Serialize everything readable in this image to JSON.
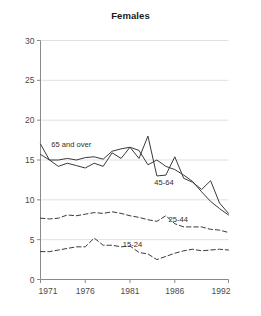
{
  "chart_data": {
    "type": "line",
    "title": "Females",
    "xlabel": "",
    "ylabel": "",
    "xlim": [
      1971,
      1992
    ],
    "ylim": [
      0,
      30
    ],
    "grid": true,
    "legend_position": "inline-labels",
    "x": [
      1971,
      1972,
      1973,
      1974,
      1975,
      1976,
      1977,
      1978,
      1979,
      1980,
      1981,
      1982,
      1983,
      1984,
      1985,
      1986,
      1987,
      1988,
      1989,
      1990,
      1991,
      1992
    ],
    "xticks": [
      1971,
      1976,
      1981,
      1986,
      1992
    ],
    "xticklabels": [
      "1971",
      "1976",
      "1981",
      "1986",
      "1992"
    ],
    "yticks": [
      0,
      5,
      10,
      15,
      20,
      25,
      30
    ],
    "yticklabels": [
      "0",
      "5",
      "10",
      "15",
      "20",
      "25",
      "30"
    ],
    "series": [
      {
        "name": "65 and over",
        "style": "solid",
        "label": "65 and over",
        "values": [
          17.0,
          15.0,
          14.2,
          14.6,
          14.3,
          14.0,
          14.6,
          14.2,
          15.9,
          15.2,
          16.6,
          15.2,
          18.0,
          13.0,
          13.1,
          15.4,
          12.7,
          12.2,
          11.3,
          12.4,
          9.6,
          8.3
        ]
      },
      {
        "name": "45-64",
        "style": "solid",
        "label": "45-64",
        "values": [
          15.7,
          15.0,
          15.0,
          15.2,
          15.0,
          15.3,
          15.4,
          15.1,
          16.1,
          16.4,
          16.6,
          16.2,
          14.4,
          15.0,
          14.2,
          13.8,
          13.1,
          12.3,
          11.0,
          9.8,
          8.9,
          8.1
        ]
      },
      {
        "name": "25-44",
        "style": "dashed",
        "label": "25-44",
        "values": [
          7.7,
          7.6,
          7.7,
          8.1,
          8.0,
          8.2,
          8.4,
          8.3,
          8.5,
          8.3,
          8.0,
          7.8,
          7.5,
          7.3,
          8.0,
          7.0,
          6.6,
          6.6,
          6.6,
          6.3,
          6.2,
          5.9
        ]
      },
      {
        "name": "15-24",
        "style": "dashed",
        "label": "15-24",
        "values": [
          3.5,
          3.5,
          3.7,
          3.9,
          4.1,
          4.1,
          5.2,
          4.3,
          4.3,
          4.1,
          4.2,
          3.4,
          3.2,
          2.5,
          2.9,
          3.3,
          3.6,
          3.8,
          3.6,
          3.7,
          3.8,
          3.7
        ]
      }
    ],
    "annotations": [
      {
        "text": "65 and over",
        "x": 1972.2,
        "y": 16.6,
        "anchor": "start"
      },
      {
        "text": "45-64",
        "x": 1983.7,
        "y": 11.9,
        "anchor": "start"
      },
      {
        "text": "25-44",
        "x": 1985.3,
        "y": 7.2,
        "anchor": "start"
      },
      {
        "text": "15-24",
        "x": 1980.2,
        "y": 4.1,
        "anchor": "start"
      }
    ]
  }
}
